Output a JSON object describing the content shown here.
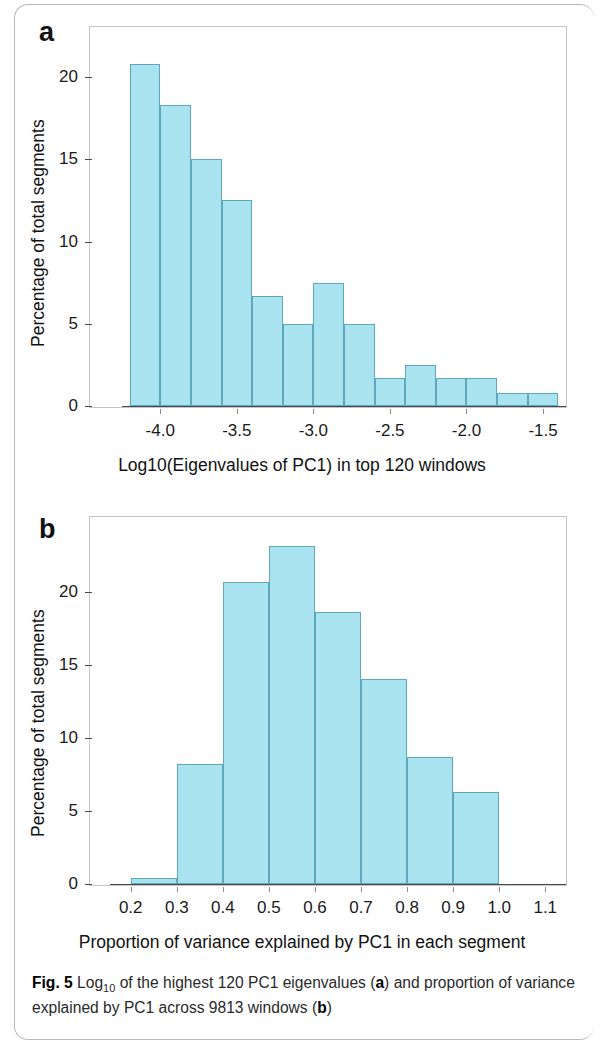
{
  "figure": {
    "caption_label": "Fig. 5",
    "caption_part1": " Log",
    "caption_sub": "10",
    "caption_part2": " of the highest 120 PC1 eigenvalues (",
    "caption_bold_a": "a",
    "caption_part3": ") and proportion of variance explained by PC1 across 9813 windows (",
    "caption_bold_b": "b",
    "caption_part4": ")",
    "bar_fill": "#a9e3f0",
    "bar_stroke": "#5fa8bb"
  },
  "panel_a": {
    "letter": "a",
    "xlabel": "Log10(Eigenvalues of PC1) in top 120 windows",
    "ylabel": "Percentage of total segments"
  },
  "panel_b": {
    "letter": "b",
    "xlabel": "Proportion of variance explained by PC1 in each segment",
    "ylabel": "Percentage of total segments"
  },
  "chart_data": [
    {
      "type": "bar",
      "panel": "a",
      "title": "",
      "xlabel": "Log10(Eigenvalues of PC1) in top 120 windows",
      "ylabel": "Percentage of total segments",
      "xlim": [
        -4.25,
        -1.35
      ],
      "ylim": [
        0,
        22.5
      ],
      "xticks": [
        -4.0,
        -3.5,
        -3.0,
        -2.5,
        -2.0,
        -1.5
      ],
      "xtick_labels": [
        "-4.0",
        "-3.5",
        "-3.0",
        "-2.5",
        "-2.0",
        "-1.5"
      ],
      "yticks": [
        0,
        5,
        10,
        15,
        20
      ],
      "ytick_labels": [
        "0",
        "5",
        "10",
        "15",
        "20"
      ],
      "grid": false,
      "legend": null,
      "bin_width": 0.2,
      "bin_edges": [
        -4.2,
        -4.0,
        -3.8,
        -3.6,
        -3.4,
        -3.2,
        -3.0,
        -2.8,
        -2.6,
        -2.4,
        -2.2,
        -2.0,
        -1.8,
        -1.6,
        -1.4
      ],
      "values": [
        20.8,
        18.3,
        15.0,
        12.5,
        6.7,
        5.0,
        7.5,
        5.0,
        1.7,
        2.5,
        1.7,
        1.7,
        0.8,
        0.8
      ]
    },
    {
      "type": "bar",
      "panel": "b",
      "title": "",
      "xlabel": "Proportion of variance explained by PC1 in each segment",
      "ylabel": "Percentage of total segments",
      "xlim": [
        0.155,
        1.145
      ],
      "ylim": [
        0,
        24.5
      ],
      "xticks": [
        0.2,
        0.3,
        0.4,
        0.5,
        0.6,
        0.7,
        0.8,
        0.9,
        1.0,
        1.1
      ],
      "xtick_labels": [
        "0.2",
        "0.3",
        "0.4",
        "0.5",
        "0.6",
        "0.7",
        "0.8",
        "0.9",
        "1.0",
        "1.1"
      ],
      "yticks": [
        0,
        5,
        10,
        15,
        20
      ],
      "ytick_labels": [
        "0",
        "5",
        "10",
        "15",
        "20"
      ],
      "grid": false,
      "legend": null,
      "bin_width": 0.1,
      "bin_edges": [
        0.2,
        0.3,
        0.4,
        0.5,
        0.6,
        0.7,
        0.8,
        0.9,
        1.0
      ],
      "values": [
        0.4,
        8.2,
        20.7,
        23.1,
        18.6,
        14.0,
        8.7,
        6.3
      ]
    }
  ]
}
